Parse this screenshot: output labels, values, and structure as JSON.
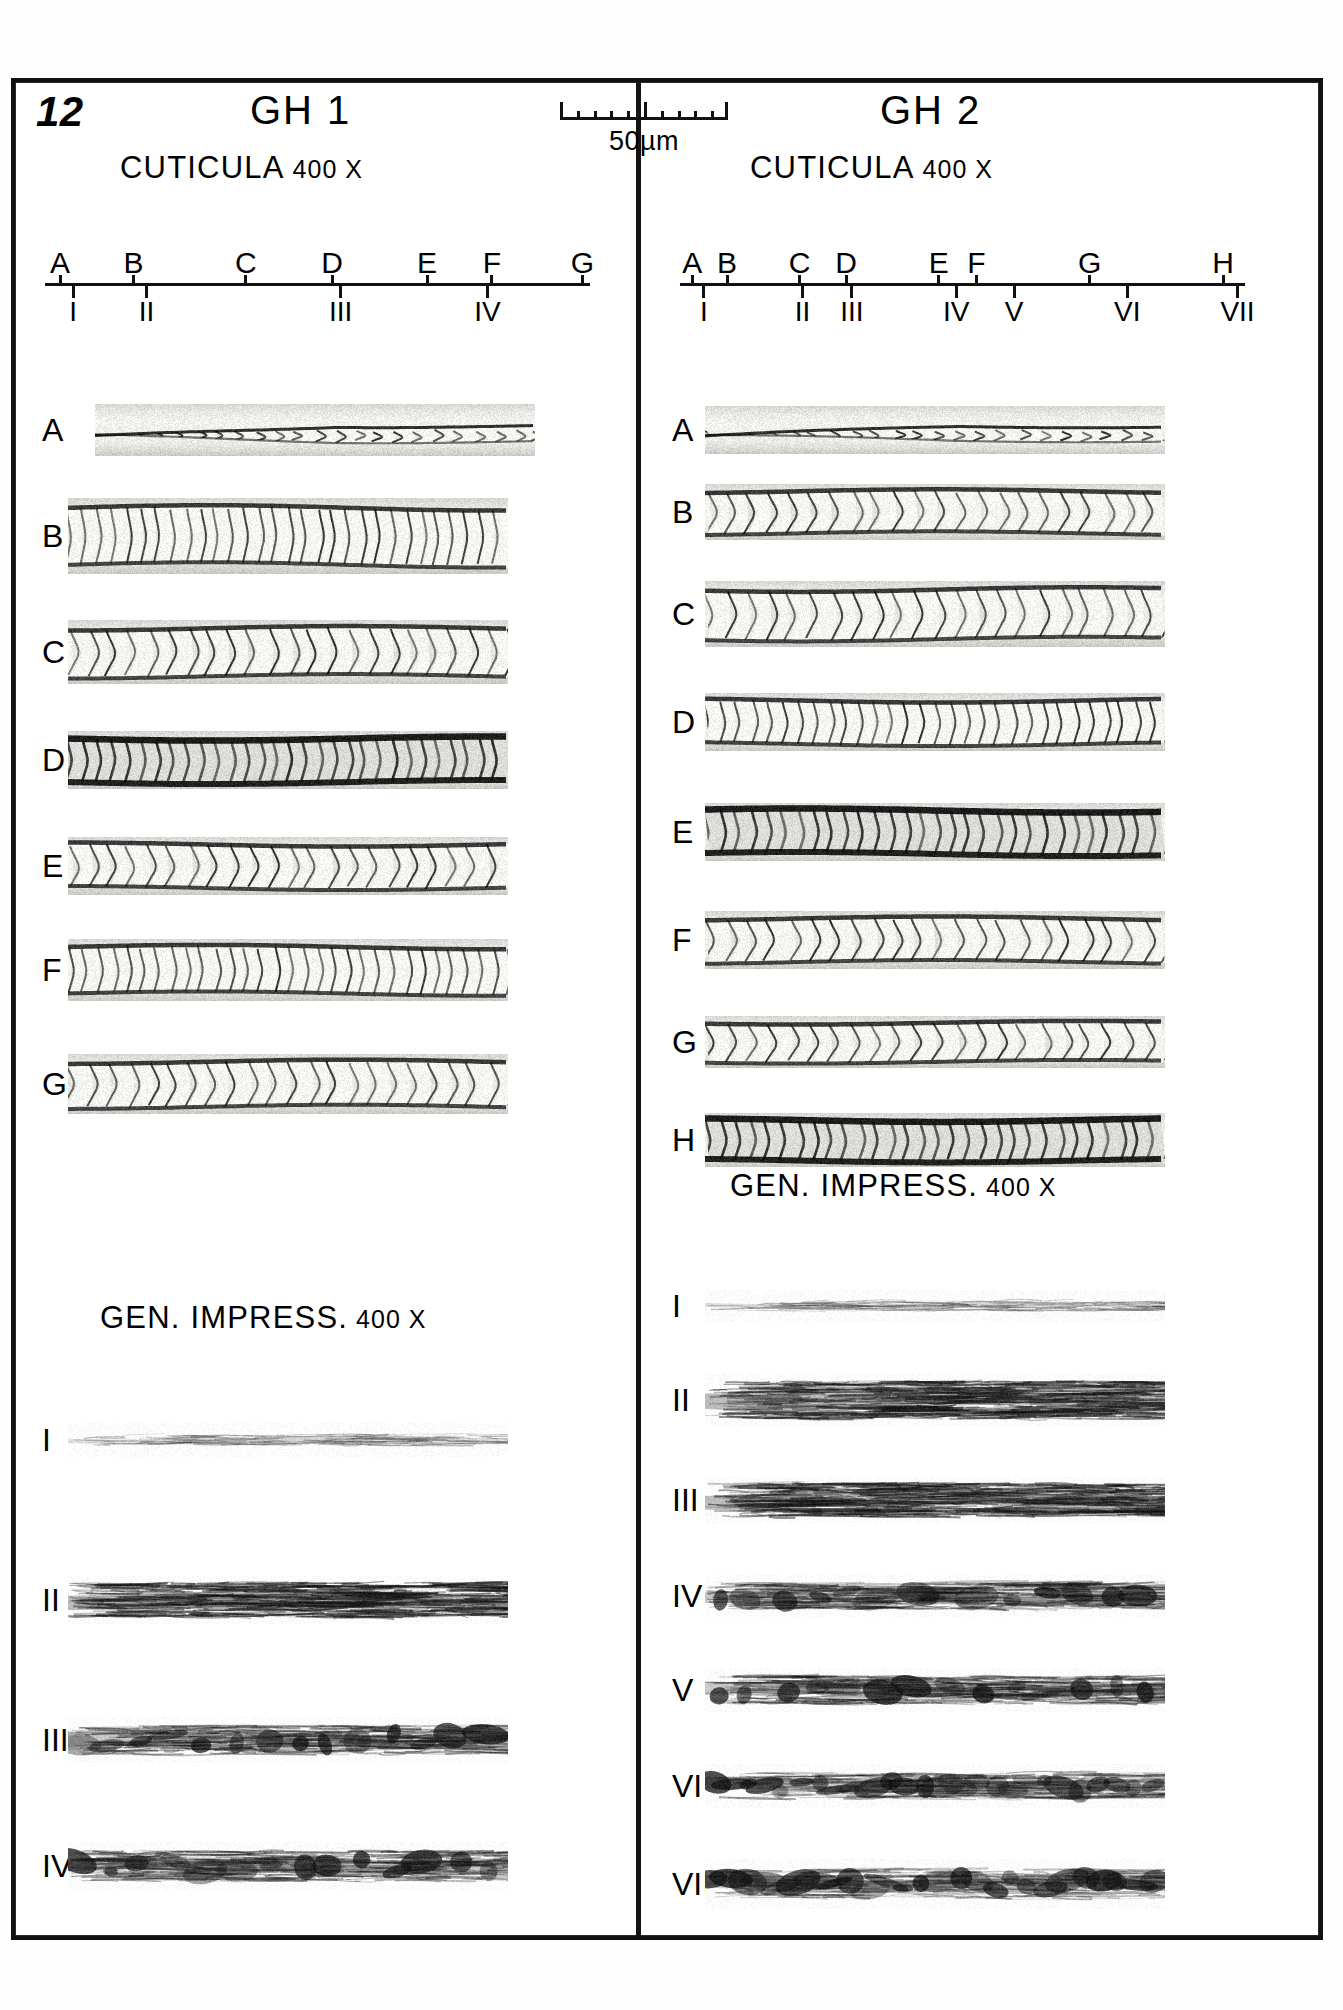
{
  "plate": {
    "number": "12",
    "background_color": "#ffffff",
    "ink_color": "#111111"
  },
  "scale_bar": {
    "caption": "50µm",
    "total_ticks": 11,
    "major_tick_indices": [
      0,
      5,
      10
    ]
  },
  "columns": [
    {
      "id": "gh1",
      "title": "GH 1",
      "cuticula_label": "CUTICULA",
      "cuticula_magnification": "400 X",
      "impression_label": "GEN.  IMPRESS.",
      "impression_magnification": "400 X",
      "axis": {
        "upper_labels": [
          "A",
          "B",
          "C",
          "D",
          "E",
          "F",
          "G"
        ],
        "upper_positions": [
          2,
          19,
          45,
          65,
          87,
          102,
          123
        ],
        "lower_labels": [
          "I",
          "II",
          "III",
          "IV"
        ],
        "lower_positions": [
          5,
          22,
          67,
          101
        ]
      },
      "cuticula_rows": [
        {
          "label": "A",
          "y": 430,
          "height": 52,
          "width": 440,
          "x": 95,
          "seed": 11,
          "style": "tapered-light"
        },
        {
          "label": "B",
          "y": 536,
          "height": 76,
          "width": 440,
          "x": 68,
          "seed": 22,
          "style": "chevron-dense"
        },
        {
          "label": "C",
          "y": 652,
          "height": 64,
          "width": 440,
          "x": 68,
          "seed": 33,
          "style": "chevron-open"
        },
        {
          "label": "D",
          "y": 760,
          "height": 58,
          "width": 440,
          "x": 68,
          "seed": 44,
          "style": "chevron-dark"
        },
        {
          "label": "E",
          "y": 866,
          "height": 58,
          "width": 440,
          "x": 68,
          "seed": 55,
          "style": "chevron-open"
        },
        {
          "label": "F",
          "y": 970,
          "height": 62,
          "width": 440,
          "x": 68,
          "seed": 66,
          "style": "chevron-dense"
        },
        {
          "label": "G",
          "y": 1084,
          "height": 60,
          "width": 440,
          "x": 68,
          "seed": 77,
          "style": "chevron-open"
        }
      ],
      "impression_rows": [
        {
          "label": "I",
          "y": 1440,
          "height": 34,
          "width": 440,
          "x": 68,
          "seed": 101,
          "style": "fiber-light"
        },
        {
          "label": "II",
          "y": 1600,
          "height": 48,
          "width": 440,
          "x": 68,
          "seed": 102,
          "style": "fiber-dark"
        },
        {
          "label": "III",
          "y": 1740,
          "height": 46,
          "width": 440,
          "x": 68,
          "seed": 103,
          "style": "fiber-mottled"
        },
        {
          "label": "IV",
          "y": 1866,
          "height": 48,
          "width": 440,
          "x": 68,
          "seed": 104,
          "style": "fiber-mottled"
        }
      ]
    },
    {
      "id": "gh2",
      "title": "GH 2",
      "cuticula_label": "CUTICULA",
      "cuticula_magnification": "400 X",
      "impression_label": "GEN.  IMPRESS.",
      "impression_magnification": "400 X",
      "axis": {
        "upper_labels": [
          "A",
          "B",
          "C",
          "D",
          "E",
          "F",
          "G",
          "H"
        ],
        "upper_positions": [
          2,
          14,
          39,
          55,
          87,
          100,
          139,
          185
        ],
        "lower_labels": [
          "I",
          "II",
          "III",
          "IV",
          "V",
          "VI",
          "VII"
        ],
        "lower_positions": [
          6,
          40,
          57,
          93,
          113,
          152,
          190
        ]
      },
      "cuticula_rows": [
        {
          "label": "A",
          "y": 430,
          "height": 48,
          "width": 460,
          "x": 705,
          "seed": 211,
          "style": "tapered-light"
        },
        {
          "label": "B",
          "y": 512,
          "height": 56,
          "width": 460,
          "x": 705,
          "seed": 222,
          "style": "chevron-open"
        },
        {
          "label": "C",
          "y": 614,
          "height": 66,
          "width": 460,
          "x": 705,
          "seed": 233,
          "style": "chevron-open"
        },
        {
          "label": "D",
          "y": 722,
          "height": 58,
          "width": 460,
          "x": 705,
          "seed": 244,
          "style": "chevron-dense"
        },
        {
          "label": "E",
          "y": 832,
          "height": 58,
          "width": 460,
          "x": 705,
          "seed": 255,
          "style": "chevron-dark"
        },
        {
          "label": "F",
          "y": 940,
          "height": 58,
          "width": 460,
          "x": 705,
          "seed": 266,
          "style": "chevron-open"
        },
        {
          "label": "G",
          "y": 1042,
          "height": 52,
          "width": 460,
          "x": 705,
          "seed": 277,
          "style": "chevron-open"
        },
        {
          "label": "H",
          "y": 1140,
          "height": 54,
          "width": 460,
          "x": 705,
          "seed": 288,
          "style": "chevron-dark"
        }
      ],
      "impression_rows": [
        {
          "label": "I",
          "y": 1306,
          "height": 32,
          "width": 460,
          "x": 705,
          "seed": 301,
          "style": "fiber-light"
        },
        {
          "label": "II",
          "y": 1400,
          "height": 52,
          "width": 460,
          "x": 705,
          "seed": 302,
          "style": "fiber-dark"
        },
        {
          "label": "III",
          "y": 1500,
          "height": 46,
          "width": 460,
          "x": 705,
          "seed": 303,
          "style": "fiber-dark"
        },
        {
          "label": "IV",
          "y": 1596,
          "height": 42,
          "width": 460,
          "x": 705,
          "seed": 304,
          "style": "fiber-mottled"
        },
        {
          "label": "V",
          "y": 1690,
          "height": 44,
          "width": 460,
          "x": 705,
          "seed": 305,
          "style": "fiber-mottled"
        },
        {
          "label": "VI",
          "y": 1786,
          "height": 44,
          "width": 460,
          "x": 705,
          "seed": 306,
          "style": "fiber-blob"
        },
        {
          "label": "VII",
          "y": 1884,
          "height": 50,
          "width": 460,
          "x": 705,
          "seed": 307,
          "style": "fiber-blob"
        }
      ]
    }
  ],
  "layout": {
    "col1_title_x": 250,
    "col1_title_y": 88,
    "col2_title_x": 880,
    "col2_title_y": 88,
    "col1_cuticula_x": 120,
    "col1_cuticula_y": 150,
    "col2_cuticula_x": 750,
    "col2_cuticula_y": 150,
    "col1_axis_x": 45,
    "col1_axis_y": 250,
    "col1_axis_w": 545,
    "col2_axis_x": 680,
    "col2_axis_y": 250,
    "col2_axis_w": 565,
    "col1_impress_x": 100,
    "col1_impress_y": 1300,
    "col2_impress_x": 730,
    "col2_impress_y": 1168,
    "label_col1_x": 42,
    "label_col2_x": 672
  }
}
